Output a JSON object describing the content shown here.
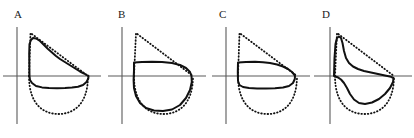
{
  "figure": {
    "kind": "line",
    "panel_count": 4,
    "width": 414,
    "height": 138,
    "background_color": "#ffffff",
    "axis_color": "#5a5a5a",
    "curve_color": "#111111"
  },
  "panels": [
    {
      "label": "A",
      "label_x": 14,
      "label_y": 9,
      "origin_x": 17,
      "origin_y": 76,
      "x_axis": {
        "x1": 3,
        "y1": 76,
        "x2": 101,
        "y2": 76
      },
      "y_axis": {
        "x1": 17,
        "y1": 27,
        "x2": 17,
        "y2": 124
      },
      "curves": [
        {
          "name": "reference-envelope",
          "style": "dotted",
          "path": "M 29 76 L 30.5 33 L 88 76"
        },
        {
          "name": "reference-semicircle",
          "style": "dotted",
          "path": "M 29 76 C 29 105 44 114 58.5 114 C 73 114 88 105 88 76"
        },
        {
          "name": "measured-loop",
          "style": "solid",
          "path": "M 29.5 76 L 29.2 54 L 29.5 44 L 31 40 L 33 38 L 36 38.5 L 40 41 L 44 45 L 48 49 L 52 52.5 L 56 56 L 60 59 L 64 61.5 L 68 64 L 72 66.5 L 76 69 L 80 71.5 L 84 73.5 L 87.5 75.5 L 88.5 76 L 88.3 78.5 L 86.5 82 L 83 85 L 78 86.8 L 72 87.6 L 65 88 L 57 88.2 L 49 88 L 42 87.4 L 36 86 L 32 83 L 30 80 L 29.5 76 Z"
        }
      ]
    },
    {
      "label": "B",
      "label_x": 118,
      "label_y": 9,
      "origin_x": 122,
      "origin_y": 76,
      "x_axis": {
        "x1": 108,
        "y1": 76,
        "x2": 206,
        "y2": 76
      },
      "y_axis": {
        "x1": 122,
        "y1": 27,
        "x2": 122,
        "y2": 124
      },
      "curves": [
        {
          "name": "reference-envelope",
          "style": "dotted",
          "path": "M 134 76 L 136 33 L 193 76"
        },
        {
          "name": "reference-semicircle",
          "style": "dotted",
          "path": "M 134 76 C 134 105 149 114 163.5 114 C 178 114 193 105 193 76"
        },
        {
          "name": "measured-loop",
          "style": "solid",
          "path": "M 134 62.5 L 142 62 L 152 61.8 L 162 62 L 172 63 L 180 65 L 186 68 L 190 72 L 191.5 76 L 191.8 82 L 190 90 L 186 98 L 180 105 L 172 109.5 L 163 111 L 154 110.5 L 146 108 L 140 103 L 136 96 L 134 88 L 133.6 80 L 134 70 Z"
        }
      ]
    },
    {
      "label": "C",
      "label_x": 219,
      "label_y": 9,
      "origin_x": 226,
      "origin_y": 76,
      "x_axis": {
        "x1": 212,
        "y1": 76,
        "x2": 310,
        "y2": 76
      },
      "y_axis": {
        "x1": 226,
        "y1": 27,
        "x2": 226,
        "y2": 124
      },
      "curves": [
        {
          "name": "reference-envelope",
          "style": "dotted",
          "path": "M 238 76 L 239.5 33 L 297 76"
        },
        {
          "name": "reference-semicircle",
          "style": "dotted",
          "path": "M 238 76 C 238 105 253 114 267.5 114 C 282 114 297 105 297 76"
        },
        {
          "name": "measured-loop",
          "style": "solid",
          "path": "M 238 62.5 L 246 62 L 255 61.8 L 263 62.2 L 270 63 L 277 64.5 L 283 66.5 L 288 69 L 292 72 L 294.5 75 L 295 76 L 294.8 79 L 293 83 L 289 86 L 283 87.5 L 275 88.3 L 266 88.6 L 257 88.5 L 249 88 L 243 87 L 239.5 85 L 238 81 L 237.8 72 Z"
        }
      ]
    },
    {
      "label": "D",
      "label_x": 322,
      "label_y": 9,
      "origin_x": 330,
      "origin_y": 76,
      "x_axis": {
        "x1": 314,
        "y1": 76,
        "x2": 412,
        "y2": 76
      },
      "y_axis": {
        "x1": 330,
        "y1": 27,
        "x2": 330,
        "y2": 124
      },
      "curves": [
        {
          "name": "reference-envelope",
          "style": "dotted",
          "path": "M 335 76 L 337 33 L 394 76"
        },
        {
          "name": "reference-semicircle",
          "style": "dotted",
          "path": "M 335 76 C 335 105 350 114 364.5 114 C 379 114 394 105 394 76"
        },
        {
          "name": "measured-loop",
          "style": "solid",
          "path": "M 334 76 L 334.5 58 L 335.5 44 L 337 38 L 339 36.5 L 341 38 L 342.5 43 L 344 51 L 346 58 L 349 63 L 353 66.5 L 358 69 L 364 71 L 371 72.5 L 378 74 L 385 75.5 L 391 76.8 L 393.5 78 L 393 82 L 390 88 L 385 94 L 379 99 L 372 102.5 L 365 104 L 359 103 L 354 99.5 L 350 94 L 347 88 L 344 83 L 341 79.5 L 337.5 77.2 L 334 76 Z"
        }
      ]
    }
  ]
}
